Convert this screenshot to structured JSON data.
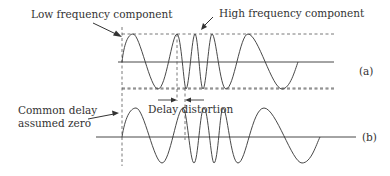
{
  "labels": {
    "low_frequency": "Low frequency component",
    "high_frequency": "High frequency component",
    "panel_a": "(a)",
    "panel_b": "(b)",
    "delay_distortion": "Delay distortion",
    "common_delay_line1": "Common delay",
    "common_delay_line2": "assumed zero"
  },
  "colors": {
    "stroke": "#333333",
    "dash": "#555555",
    "background": "#ffffff"
  }
}
